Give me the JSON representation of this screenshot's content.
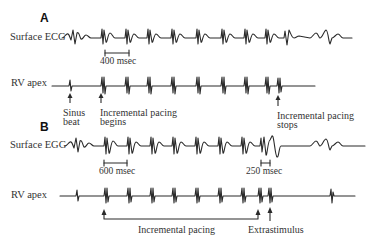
{
  "figure": {
    "panels": [
      {
        "letter": "A",
        "traces": [
          {
            "label": "Surface ECG",
            "scale_bar": "400 msec"
          },
          {
            "label": "RV apex"
          }
        ],
        "annotations": {
          "sinus_beat": [
            "Sinus",
            "beat"
          ],
          "pacing_begins": [
            "Incremental pacing",
            "begins"
          ],
          "pacing_stops": [
            "Incremental pacing",
            "stops"
          ]
        }
      },
      {
        "letter": "B",
        "traces": [
          {
            "label": "Surface EGG",
            "scale_bars": [
              "600 msec",
              "250 msec"
            ]
          },
          {
            "label": "RV apex"
          }
        ],
        "annotations": {
          "incremental_pacing": "Incremental pacing",
          "extrastimulus": "Extrastimulus"
        }
      }
    ]
  },
  "colors": {
    "trace": "#2a2a2a",
    "text": "#333333",
    "background": "#ffffff"
  }
}
